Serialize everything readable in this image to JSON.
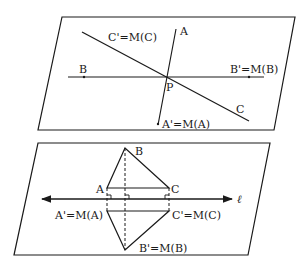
{
  "top_figure": {
    "labels": {
      "c_prime": "C'=M(C)",
      "a": "A",
      "b": "B",
      "b_prime": "B'=M(B)",
      "p": "P",
      "c": "C",
      "a_prime": "A'=M(A)"
    }
  },
  "bottom_figure": {
    "labels": {
      "b": "B",
      "a": "A",
      "c": "C",
      "l": "ℓ",
      "a_prime": "A'=M(A)",
      "c_prime": "C'=M(C)",
      "b_prime": "B'=M(B)"
    }
  },
  "colors": {
    "stroke": "#1a1a1a",
    "background": "#ffffff"
  }
}
